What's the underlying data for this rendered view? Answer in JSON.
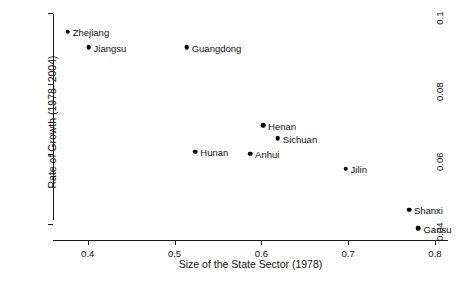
{
  "chart_data": {
    "type": "scatter",
    "title": "",
    "xlabel": "Size of the State Sector (1978)",
    "ylabel": "Rate of Growth (1978–2004)",
    "xlim": [
      0.36,
      0.815
    ],
    "ylim": [
      0.0355,
      0.1015
    ],
    "xticks": [
      0.4,
      0.5,
      0.6,
      0.7,
      0.8
    ],
    "xticklabels": [
      "0.4",
      "0.5",
      "0.6",
      "0.7",
      "0.8"
    ],
    "yticks": [
      0.04,
      0.06,
      0.08,
      0.1
    ],
    "yticklabels": [
      "0.04",
      "0.06",
      "0.08",
      "0.1"
    ],
    "grid": false,
    "legend": false,
    "marker_color": "#000000",
    "points": [
      {
        "label": "Zhejiang",
        "x": 0.377,
        "y": 0.0948,
        "label_side": "right"
      },
      {
        "label": "Jiangsu",
        "x": 0.401,
        "y": 0.0903,
        "label_side": "right"
      },
      {
        "label": "Guangdong",
        "x": 0.514,
        "y": 0.0903,
        "label_side": "right"
      },
      {
        "label": "Henan",
        "x": 0.602,
        "y": 0.0682,
        "label_side": "right"
      },
      {
        "label": "Sichuan",
        "x": 0.619,
        "y": 0.0645,
        "label_side": "right"
      },
      {
        "label": "Hunan",
        "x": 0.524,
        "y": 0.0606,
        "label_side": "right"
      },
      {
        "label": "Anhui",
        "x": 0.587,
        "y": 0.06,
        "label_side": "right"
      },
      {
        "label": "Jilin",
        "x": 0.697,
        "y": 0.0558,
        "label_side": "right"
      },
      {
        "label": "Shanxi",
        "x": 0.77,
        "y": 0.0441,
        "label_side": "right"
      },
      {
        "label": "Gansu",
        "x": 0.781,
        "y": 0.0389,
        "label_side": "right"
      }
    ]
  }
}
